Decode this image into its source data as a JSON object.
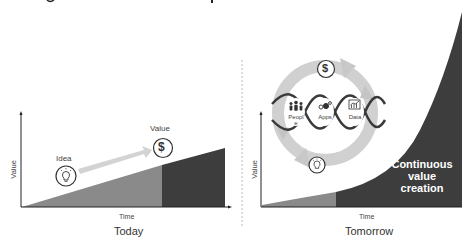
{
  "title_fragment": "",
  "colors": {
    "light_area": "#8a8a8a",
    "dark_area": "#3d3d3d",
    "arrow_fill": "#d6d6d6",
    "axis": "#222222",
    "divider": "#bbbbbb",
    "wave": "#3a3a3a"
  },
  "today": {
    "axis_y_label": "Value",
    "axis_x_label": "Time",
    "caption": "Today",
    "idea_label": "Idea",
    "value_label": "Value",
    "idea_icon": "lightbulb-icon",
    "value_icon": "dollar-icon",
    "dollar_glyph": "$"
  },
  "tomorrow": {
    "axis_y_label": "Value",
    "axis_x_label": "Time",
    "caption": "Tomorrow",
    "area_text_line1": "Continuous",
    "area_text_line2": "value",
    "area_text_line3": "creation",
    "cycle": {
      "top_icon": "dollar-icon",
      "bottom_icon": "lightbulb-icon",
      "dollar_glyph": "$",
      "nodes": [
        {
          "label_line1": "Peopl",
          "label_line2": "e",
          "icon": "people-icon"
        },
        {
          "label_line1": "Apps",
          "label_line2": "",
          "icon": "gears-icon"
        },
        {
          "label_line1": "Data",
          "label_line2": "",
          "icon": "chart-icon"
        }
      ]
    }
  }
}
